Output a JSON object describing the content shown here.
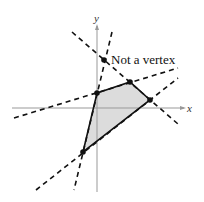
{
  "diagram": {
    "type": "feasible-region",
    "axes": {
      "x_label": "x",
      "y_label": "y"
    },
    "annotation": "Not a vertex",
    "colors": {
      "region_fill": "#dcdcdc",
      "edge": "#111111",
      "axis": "#999999",
      "dashed": "#111111"
    },
    "vertices": [
      {
        "name": "vertex-top-left",
        "x": 97,
        "y": 93
      },
      {
        "name": "vertex-top-right",
        "x": 130,
        "y": 82
      },
      {
        "name": "vertex-right",
        "x": 150,
        "y": 100
      },
      {
        "name": "vertex-bottom",
        "x": 83,
        "y": 152
      }
    ],
    "non_vertex_point": {
      "x": 104,
      "y": 60
    }
  }
}
